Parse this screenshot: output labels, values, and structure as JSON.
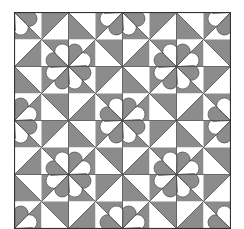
{
  "pattern": {
    "name": "heart-pinwheel-quilt",
    "grid_cells": 4,
    "cell_size": 54,
    "colors": {
      "dark": "#8c8c8c",
      "light": "#ffffff",
      "line": "#4a4a4a",
      "border": "#333333"
    }
  }
}
